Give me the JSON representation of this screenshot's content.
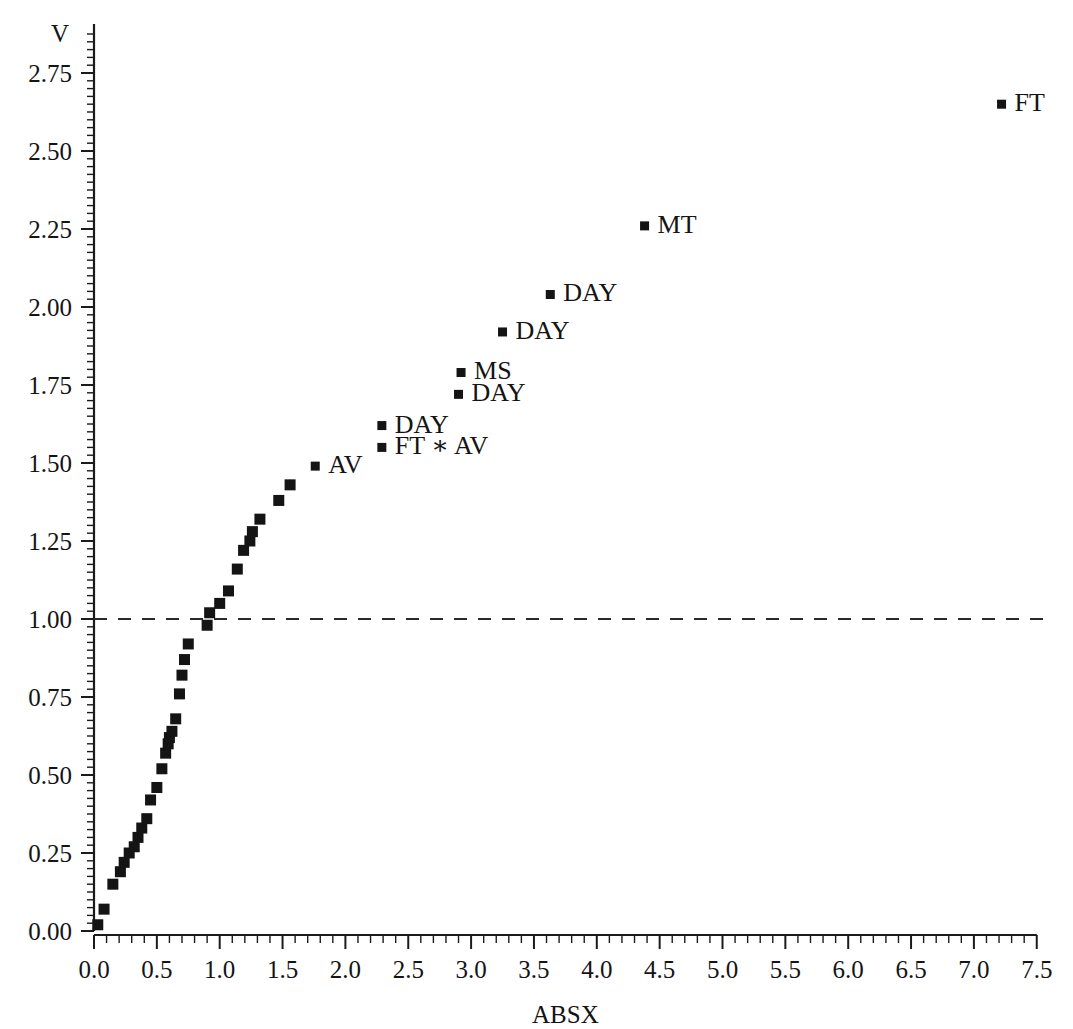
{
  "chart_data": {
    "type": "scatter",
    "title": "",
    "xlabel": "ABSX",
    "ylabel": "V",
    "xlim": [
      0.0,
      7.5
    ],
    "ylim": [
      0.0,
      2.875
    ],
    "grid": false,
    "legend": "none",
    "x_ticks": [
      "0.0",
      "0.5",
      "1.0",
      "1.5",
      "2.0",
      "2.5",
      "3.0",
      "3.5",
      "4.0",
      "4.5",
      "5.0",
      "5.5",
      "6.0",
      "6.5",
      "7.0",
      "7.5"
    ],
    "x_tick_values": [
      0.0,
      0.5,
      1.0,
      1.5,
      2.0,
      2.5,
      3.0,
      3.5,
      4.0,
      4.5,
      5.0,
      5.5,
      6.0,
      6.5,
      7.0,
      7.5
    ],
    "x_minor_step": 0.1,
    "y_ticks": [
      "0.00",
      "0.25",
      "0.50",
      "0.75",
      "1.00",
      "1.25",
      "1.50",
      "1.75",
      "2.00",
      "2.25",
      "2.50",
      "2.75"
    ],
    "y_tick_values": [
      0.0,
      0.25,
      0.5,
      0.75,
      1.0,
      1.25,
      1.5,
      1.75,
      2.0,
      2.25,
      2.5,
      2.75
    ],
    "y_minor_step": 0.025,
    "reference_lines": [
      {
        "name": "unit-reference-line",
        "orientation": "horizontal",
        "value": 1.0,
        "style": "dashed"
      }
    ],
    "points": [
      {
        "x": 0.03,
        "y": 0.02,
        "label": ""
      },
      {
        "x": 0.08,
        "y": 0.07,
        "label": ""
      },
      {
        "x": 0.15,
        "y": 0.15,
        "label": ""
      },
      {
        "x": 0.21,
        "y": 0.19,
        "label": ""
      },
      {
        "x": 0.24,
        "y": 0.22,
        "label": ""
      },
      {
        "x": 0.28,
        "y": 0.25,
        "label": ""
      },
      {
        "x": 0.32,
        "y": 0.27,
        "label": ""
      },
      {
        "x": 0.35,
        "y": 0.3,
        "label": ""
      },
      {
        "x": 0.38,
        "y": 0.33,
        "label": ""
      },
      {
        "x": 0.42,
        "y": 0.36,
        "label": ""
      },
      {
        "x": 0.45,
        "y": 0.42,
        "label": ""
      },
      {
        "x": 0.5,
        "y": 0.46,
        "label": ""
      },
      {
        "x": 0.54,
        "y": 0.52,
        "label": ""
      },
      {
        "x": 0.57,
        "y": 0.57,
        "label": ""
      },
      {
        "x": 0.59,
        "y": 0.6,
        "label": ""
      },
      {
        "x": 0.6,
        "y": 0.62,
        "label": ""
      },
      {
        "x": 0.62,
        "y": 0.64,
        "label": ""
      },
      {
        "x": 0.65,
        "y": 0.68,
        "label": ""
      },
      {
        "x": 0.68,
        "y": 0.76,
        "label": ""
      },
      {
        "x": 0.7,
        "y": 0.82,
        "label": ""
      },
      {
        "x": 0.72,
        "y": 0.87,
        "label": ""
      },
      {
        "x": 0.75,
        "y": 0.92,
        "label": ""
      },
      {
        "x": 0.9,
        "y": 0.98,
        "label": ""
      },
      {
        "x": 0.92,
        "y": 1.02,
        "label": ""
      },
      {
        "x": 1.0,
        "y": 1.05,
        "label": ""
      },
      {
        "x": 1.07,
        "y": 1.09,
        "label": ""
      },
      {
        "x": 1.14,
        "y": 1.16,
        "label": ""
      },
      {
        "x": 1.19,
        "y": 1.22,
        "label": ""
      },
      {
        "x": 1.24,
        "y": 1.25,
        "label": ""
      },
      {
        "x": 1.26,
        "y": 1.28,
        "label": ""
      },
      {
        "x": 1.32,
        "y": 1.32,
        "label": ""
      },
      {
        "x": 1.47,
        "y": 1.38,
        "label": ""
      },
      {
        "x": 1.56,
        "y": 1.43,
        "label": ""
      },
      {
        "x": 1.76,
        "y": 1.49,
        "label": "AV"
      },
      {
        "x": 2.29,
        "y": 1.62,
        "label": "DAY"
      },
      {
        "x": 2.29,
        "y": 1.55,
        "label": "FT ∗ AV"
      },
      {
        "x": 2.9,
        "y": 1.72,
        "label": "DAY"
      },
      {
        "x": 2.92,
        "y": 1.79,
        "label": "MS"
      },
      {
        "x": 3.25,
        "y": 1.92,
        "label": "DAY"
      },
      {
        "x": 3.63,
        "y": 2.04,
        "label": "DAY"
      },
      {
        "x": 4.38,
        "y": 2.26,
        "label": "MT"
      },
      {
        "x": 7.22,
        "y": 2.65,
        "label": "FT"
      }
    ]
  },
  "layout": {
    "plot_origin_px": {
      "x": 94,
      "y": 931
    },
    "x_scale_px_per_unit": 125.7,
    "y_scale_px_per_unit": 312.0,
    "marker_size_px": 11,
    "marker_size_small_px": 9,
    "label_offset_px": 13,
    "colors": {
      "marker": "#141414",
      "axis": "#1b1b1b",
      "reference_line": "#2a2a2a",
      "background": "#ffffff",
      "text": "#141414"
    }
  }
}
